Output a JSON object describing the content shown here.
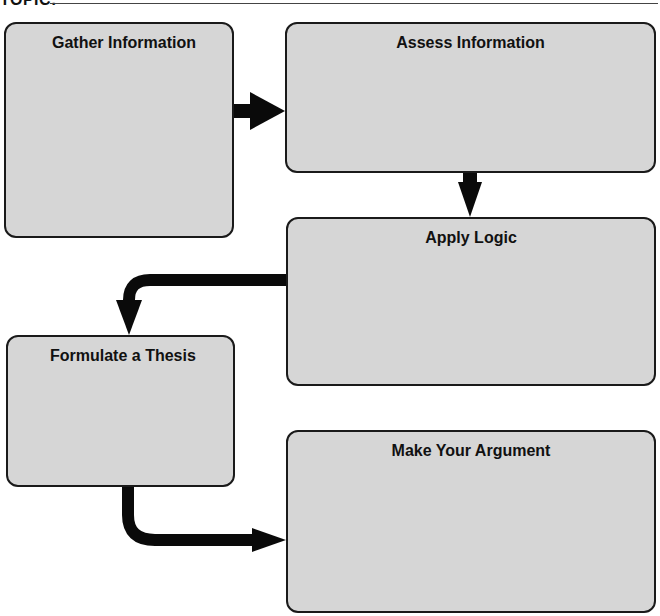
{
  "header": {
    "topic_label": "TOPIC:"
  },
  "boxes": [
    {
      "id": "gather",
      "title": "Gather Information"
    },
    {
      "id": "assess",
      "title": "Assess Information"
    },
    {
      "id": "apply",
      "title": "Apply Logic"
    },
    {
      "id": "formulate",
      "title": "Formulate a Thesis"
    },
    {
      "id": "argument",
      "title": "Make Your Argument"
    }
  ],
  "arrows": [
    {
      "from": "Gather Information",
      "to": "Assess Information",
      "direction": "right"
    },
    {
      "from": "Assess Information",
      "to": "Apply Logic",
      "direction": "down"
    },
    {
      "from": "Apply Logic",
      "to": "Formulate a Thesis",
      "direction": "left-then-down"
    },
    {
      "from": "Formulate a Thesis",
      "to": "Make Your Argument",
      "direction": "down-then-right"
    }
  ],
  "colors": {
    "box_fill": "#d6d6d6",
    "box_border": "#1a1a1a",
    "arrow": "#0a0a0a"
  }
}
